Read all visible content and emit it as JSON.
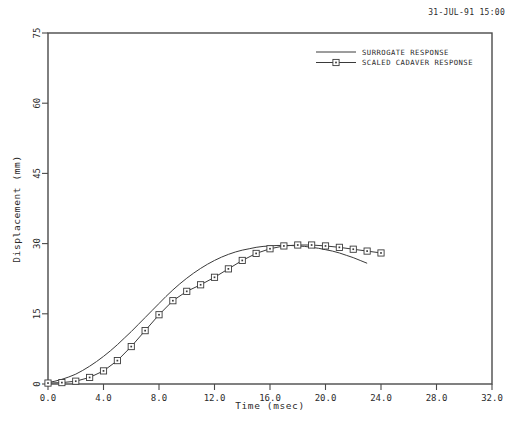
{
  "timestamp": "31-JUL-91 15:00",
  "legend": {
    "entries": [
      {
        "label": "SURROGATE RESPONSE",
        "marker": "none"
      },
      {
        "label": "SCALED CADAVER RESPONSE",
        "marker": "square"
      }
    ]
  },
  "chart_data": {
    "type": "line",
    "title": "",
    "xlabel": "Time  (msec)",
    "ylabel": "Displacement  (mm)",
    "xlim": [
      0.0,
      32.0
    ],
    "ylim": [
      0,
      75
    ],
    "xticks": [
      0.0,
      4.0,
      8.0,
      12.0,
      16.0,
      20.0,
      24.0,
      28.0,
      32.0
    ],
    "xticklabels": [
      "0.0",
      "4.0",
      "8.0",
      "12.0",
      "16.0",
      "20.0",
      "24.0",
      "28.0",
      "32.0"
    ],
    "yticks": [
      0,
      15,
      30,
      45,
      60,
      75
    ],
    "yticklabels": [
      "0",
      "15",
      "30",
      "45",
      "60",
      "75"
    ],
    "grid": false,
    "legend_position": "top-right",
    "series": [
      {
        "name": "SURROGATE RESPONSE",
        "marker": "none",
        "x": [
          0.0,
          0.5,
          1.0,
          1.5,
          2.0,
          2.5,
          3.0,
          3.5,
          4.0,
          4.5,
          5.0,
          5.5,
          6.0,
          6.5,
          7.0,
          7.5,
          8.0,
          8.5,
          9.0,
          9.5,
          10.0,
          10.5,
          11.0,
          11.5,
          12.0,
          12.5,
          13.0,
          13.5,
          14.0,
          14.5,
          15.0,
          15.5,
          16.0,
          16.5,
          17.0,
          17.5,
          18.0,
          18.5,
          19.0,
          19.5,
          20.0,
          20.5,
          21.0,
          21.5,
          22.0,
          22.5,
          23.0
        ],
        "y": [
          0.3,
          0.6,
          1.0,
          1.5,
          2.1,
          2.9,
          3.8,
          4.8,
          5.9,
          7.1,
          8.4,
          9.8,
          11.2,
          12.7,
          14.2,
          15.7,
          17.2,
          18.7,
          20.1,
          21.4,
          22.6,
          23.7,
          24.7,
          25.6,
          26.4,
          27.1,
          27.7,
          28.2,
          28.6,
          28.9,
          29.2,
          29.4,
          29.5,
          29.6,
          29.6,
          29.6,
          29.5,
          29.4,
          29.2,
          29.0,
          28.7,
          28.4,
          28.0,
          27.5,
          27.0,
          26.4,
          25.8
        ]
      },
      {
        "name": "SCALED CADAVER RESPONSE",
        "marker": "square",
        "x": [
          0.0,
          1.0,
          2.0,
          3.0,
          4.0,
          5.0,
          6.0,
          7.0,
          8.0,
          9.0,
          10.0,
          11.0,
          12.0,
          13.0,
          14.0,
          15.0,
          16.0,
          17.0,
          18.0,
          19.0,
          20.0,
          21.0,
          22.0,
          23.0,
          24.0
        ],
        "y": [
          0.2,
          0.3,
          0.6,
          1.4,
          2.8,
          5.0,
          8.0,
          11.4,
          14.8,
          17.8,
          19.8,
          21.2,
          22.8,
          24.6,
          26.4,
          27.9,
          28.9,
          29.5,
          29.7,
          29.7,
          29.5,
          29.2,
          28.8,
          28.4,
          28.0
        ]
      }
    ]
  }
}
